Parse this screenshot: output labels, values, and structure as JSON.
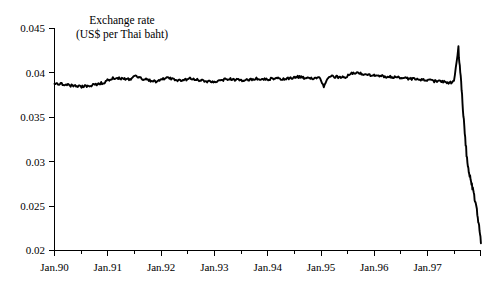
{
  "chart_data": {
    "type": "line",
    "title": "Exchange rate",
    "subtitle": "(US$ per Thai baht)",
    "xlabel": "",
    "ylabel": "",
    "grid": false,
    "legend": false,
    "ylim": [
      0.02,
      0.045
    ],
    "xlim": [
      "Jan.90",
      "Dec.97"
    ],
    "ytick_labels": [
      "0.045",
      "0.04",
      "0.035",
      "0.03",
      "0.025",
      "0.02"
    ],
    "ytick_values": [
      0.045,
      0.04,
      0.035,
      0.03,
      0.025,
      0.02
    ],
    "xtick_labels": [
      "Jan.90",
      "Jan.91",
      "Jan.92",
      "Jan.93",
      "Jan.94",
      "Jan.95",
      "Jan.96",
      "Jan.97"
    ],
    "xtick_values": [
      0,
      12,
      24,
      36,
      48,
      60,
      72,
      84
    ],
    "minor_xtick_values": [
      6,
      18,
      30,
      42,
      54,
      66,
      78,
      90
    ],
    "series": [
      {
        "name": "US$ per Thai baht",
        "x_unit": "months since Jan.90",
        "x": [
          0,
          1,
          2,
          3,
          4,
          5,
          6,
          7,
          8,
          9,
          10,
          11,
          12,
          13,
          14,
          15,
          16,
          17,
          18,
          19,
          20,
          21,
          22,
          23,
          24,
          25,
          26,
          27,
          28,
          29,
          30,
          31,
          32,
          33,
          34,
          35,
          36,
          37,
          38,
          39,
          40,
          41,
          42,
          43,
          44,
          45,
          46,
          47,
          48,
          49,
          50,
          51,
          52,
          53,
          54,
          55,
          56,
          57,
          58,
          59,
          60,
          61,
          62,
          63,
          64,
          65,
          66,
          67,
          68,
          69,
          70,
          71,
          72,
          73,
          74,
          75,
          76,
          77,
          78,
          79,
          80,
          81,
          82,
          83,
          84,
          85,
          86,
          87,
          88,
          89,
          90,
          91,
          92,
          93,
          94,
          95
        ],
        "values": [
          0.0388,
          0.03875,
          0.03872,
          0.03862,
          0.03855,
          0.0385,
          0.03845,
          0.03852,
          0.03858,
          0.03868,
          0.0388,
          0.0389,
          0.0392,
          0.0394,
          0.03945,
          0.03935,
          0.03925,
          0.0393,
          0.0396,
          0.03945,
          0.0393,
          0.03915,
          0.03905,
          0.039,
          0.03925,
          0.03945,
          0.03935,
          0.0392,
          0.03915,
          0.0392,
          0.03935,
          0.0393,
          0.0392,
          0.0391,
          0.03905,
          0.039,
          0.03905,
          0.03915,
          0.03925,
          0.0393,
          0.03925,
          0.03918,
          0.03912,
          0.03918,
          0.03928,
          0.03935,
          0.0393,
          0.03925,
          0.0393,
          0.0394,
          0.03935,
          0.03928,
          0.03935,
          0.03945,
          0.03955,
          0.0395,
          0.03942,
          0.03938,
          0.03942,
          0.03948,
          0.0385,
          0.03955,
          0.0396,
          0.03955,
          0.03948,
          0.03952,
          0.0399,
          0.04,
          0.03995,
          0.03985,
          0.03975,
          0.0397,
          0.03968,
          0.03962,
          0.03958,
          0.03955,
          0.0395,
          0.03945,
          0.0394,
          0.03935,
          0.0393,
          0.03925,
          0.0392,
          0.03915,
          0.0391,
          0.03905,
          0.039,
          0.03895,
          0.0389,
          0.039,
          0.0427,
          0.036,
          0.0295,
          0.0272,
          0.025,
          0.0208
        ],
        "note": "Stable near 0.0385-0.0400 from Jan.90 to mid-1997, brief spike to 0.0427, then sharp depreciation to about 0.0208 by end of 1997 (Asian financial crisis)."
      }
    ]
  }
}
